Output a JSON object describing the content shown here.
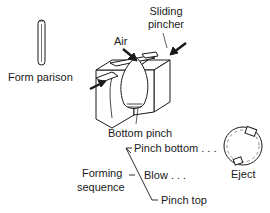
{
  "diagram": {
    "labels": {
      "form_parison": "Form parison",
      "sliding_pincher_line1": "Sliding",
      "sliding_pincher_line2": "pincher",
      "air": "Air",
      "bottom_pinch": "Bottom pinch",
      "forming_sequence_line1": "Forming",
      "forming_sequence_line2": "sequence",
      "pinch_bottom": "Pinch bottom . . .",
      "blow": "Blow . . .",
      "pinch_top": "Pinch top",
      "eject": "Eject"
    },
    "colors": {
      "line": "#1a1a1a",
      "fill": "#ffffff",
      "background": "#ffffff"
    }
  }
}
